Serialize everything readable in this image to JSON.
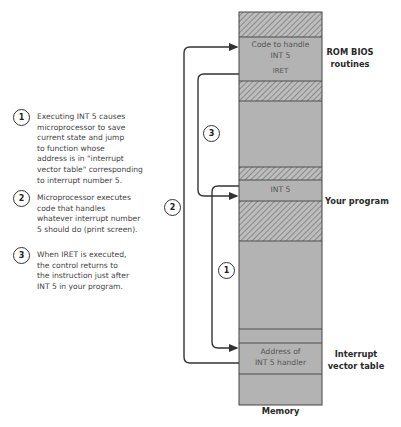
{
  "notes": [
    {
      "number": "1",
      "lines": [
        "Executing INT 5 causes",
        "microprocessor to save",
        "current state and jump",
        "to function whose",
        "address is in \"interrupt",
        "vector table\" corresponding",
        "to interrupt number 5."
      ]
    },
    {
      "number": "2",
      "lines": [
        "Microprocessor executes",
        "code that handles",
        "whatever interrupt number",
        "5 should do (print screen)."
      ]
    },
    {
      "number": "3",
      "lines": [
        "When IRET is executed,",
        "the control returns to",
        "the instruction just after",
        "INT 5 in your program."
      ]
    }
  ],
  "memory": {
    "label": "Memory",
    "blocks": {
      "handler_line1": "Code to handle",
      "handler_line2": "INT 5",
      "iret": "IRET",
      "int5": "INT 5",
      "address_line1": "Address of",
      "address_line2": "INT 5 handler"
    }
  },
  "side_labels": {
    "rom_line1": "ROM BIOS",
    "rom_line2": "routines",
    "program": "Your program",
    "ivt_line1": "Interrupt",
    "ivt_line2": "vector table"
  },
  "arrow_badges": [
    "1",
    "2",
    "3"
  ],
  "colors": {
    "fill": "#b3b3b3",
    "hatch": "#7d7d7d",
    "line": "#333333"
  }
}
